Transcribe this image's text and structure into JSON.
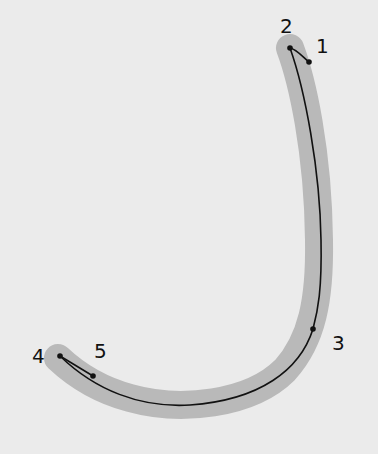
{
  "diagram": {
    "background_color": "#ebebeb",
    "band_color": "#b9b9b9",
    "line_color": "#111111",
    "points": [
      {
        "label": "1",
        "x": 309,
        "y": 62,
        "label_x": 316,
        "label_y": 53
      },
      {
        "label": "2",
        "x": 290,
        "y": 48,
        "label_x": 280,
        "label_y": 33
      },
      {
        "label": "3",
        "x": 313,
        "y": 329,
        "label_x": 332,
        "label_y": 350
      },
      {
        "label": "4",
        "x": 60,
        "y": 356,
        "label_x": 32,
        "label_y": 363
      },
      {
        "label": "5",
        "x": 93,
        "y": 376,
        "label_x": 94,
        "label_y": 358
      }
    ]
  }
}
